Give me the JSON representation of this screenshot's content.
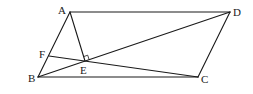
{
  "diagram": {
    "type": "geometry",
    "shape": "parallelogram ABCD",
    "points": {
      "A": {
        "label": "A"
      },
      "B": {
        "label": "B"
      },
      "C": {
        "label": "C"
      },
      "D": {
        "label": "D"
      },
      "E": {
        "label": "E"
      },
      "F": {
        "label": "F"
      }
    },
    "segments": [
      {
        "from": "A",
        "to": "D"
      },
      {
        "from": "D",
        "to": "C"
      },
      {
        "from": "C",
        "to": "B"
      },
      {
        "from": "B",
        "to": "A"
      },
      {
        "from": "B",
        "to": "D"
      },
      {
        "from": "A",
        "to": "E"
      },
      {
        "from": "F",
        "to": "C"
      }
    ],
    "right_angle": {
      "at": "E",
      "between": [
        "A",
        "D"
      ]
    },
    "colors": {
      "stroke": "#1a1a1a",
      "background": "#ffffff"
    }
  }
}
